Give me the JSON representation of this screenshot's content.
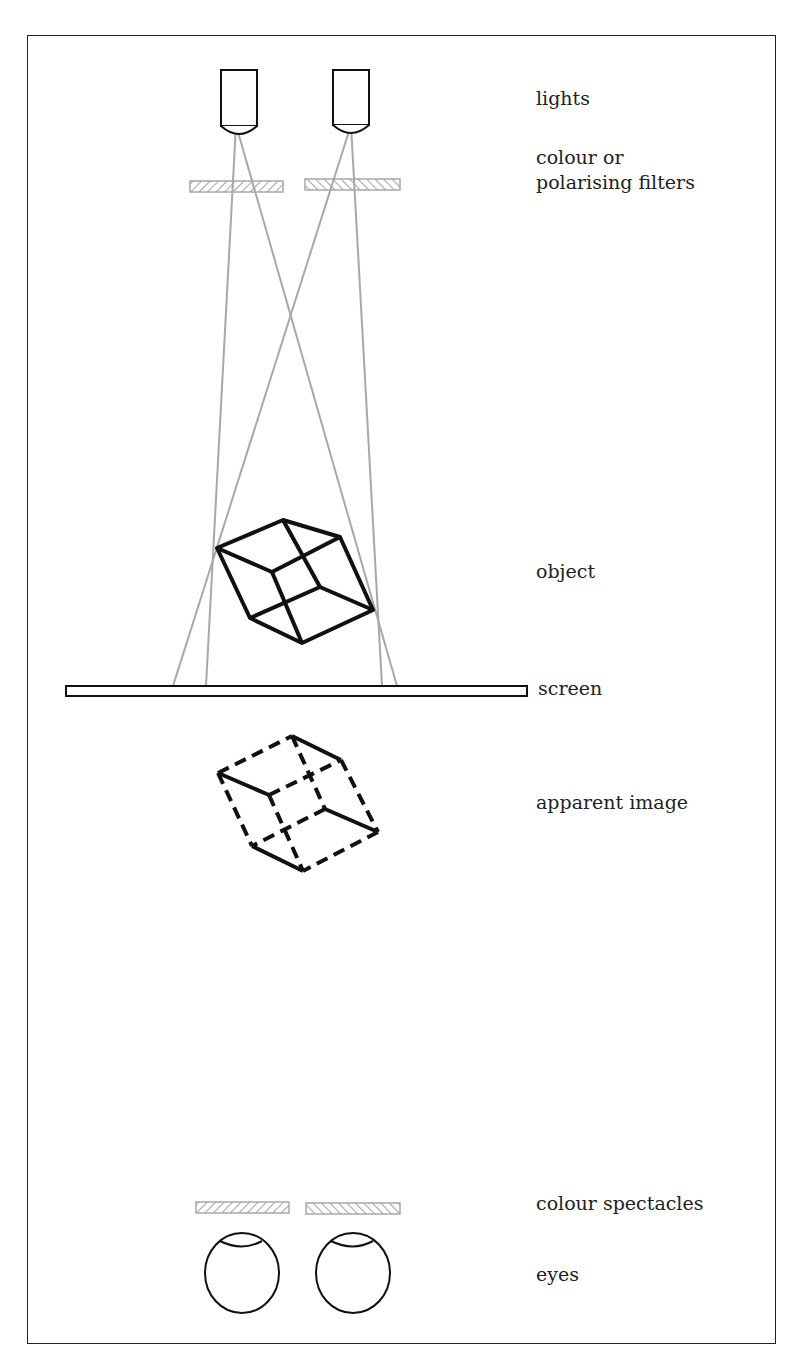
{
  "figure": {
    "labels": {
      "lights": "lights",
      "filters_line1": "colour or",
      "filters_line2": "polarising filters",
      "object": "object",
      "screen": "screen",
      "apparent_image": "apparent image",
      "spectacles": "colour  spectacles",
      "eyes": "eyes"
    },
    "colors": {
      "stroke": "#111111",
      "ray": "#a8a8a8",
      "filter": "#b0b0b0",
      "background": "#ffffff"
    },
    "icons": {
      "light": "projector-lamp-icon",
      "filter": "hatched-filter-icon",
      "eye": "eyeball-icon"
    }
  }
}
